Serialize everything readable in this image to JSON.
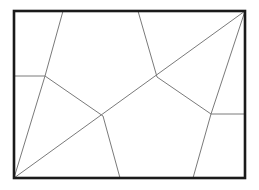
{
  "diagram": {
    "type": "line-diagram",
    "canvas": {
      "width": 259,
      "height": 190,
      "background": "#ffffff"
    },
    "style": {
      "frame_color": "#1a1a1a",
      "frame_width": 2.6,
      "line_color": "#7a7a7a",
      "line_width": 1,
      "fill_color": "#ffffff"
    },
    "frame": {
      "name": "bounding-rectangle",
      "x": 14,
      "y": 11,
      "width": 231,
      "height": 167,
      "corners": {
        "top_left": [
          14,
          11
        ],
        "top_right": [
          245,
          11
        ],
        "bottom_right": [
          245,
          178
        ],
        "bottom_left": [
          14,
          178
        ]
      }
    },
    "vertices": [
      {
        "id": "A",
        "label": "junction-upper-left",
        "x": 45,
        "y": 76,
        "degree": 3
      },
      {
        "id": "B",
        "label": "junction-center-left",
        "x": 103,
        "y": 116,
        "degree": 4
      },
      {
        "id": "C",
        "label": "junction-center-right",
        "x": 157,
        "y": 77,
        "degree": 4
      },
      {
        "id": "D",
        "label": "junction-right",
        "x": 211,
        "y": 114,
        "degree": 3
      },
      {
        "id": "T1",
        "label": "top-edge-point-1",
        "x": 63,
        "y": 11,
        "degree": 1
      },
      {
        "id": "T2",
        "label": "top-edge-point-2",
        "x": 138,
        "y": 11,
        "degree": 1
      },
      {
        "id": "L1",
        "label": "left-edge-point",
        "x": 14,
        "y": 76,
        "degree": 1
      },
      {
        "id": "R1",
        "label": "right-edge-point",
        "x": 245,
        "y": 114,
        "degree": 1
      },
      {
        "id": "B1",
        "label": "bottom-edge-point-1",
        "x": 120,
        "y": 178,
        "degree": 1
      },
      {
        "id": "B2",
        "label": "bottom-edge-point-2",
        "x": 193,
        "y": 178,
        "degree": 1
      },
      {
        "id": "TR",
        "label": "corner-top-right",
        "x": 245,
        "y": 11,
        "degree": 2
      },
      {
        "id": "BL",
        "label": "corner-bottom-left",
        "x": 14,
        "y": 178,
        "degree": 2
      }
    ],
    "segments": [
      {
        "name": "segment-left-horizontal",
        "from": "L1",
        "to": "A",
        "x1": 14,
        "y1": 76,
        "x2": 45,
        "y2": 76
      },
      {
        "name": "segment-a-to-top-edge",
        "from": "A",
        "to": "T1",
        "x1": 45,
        "y1": 76,
        "x2": 63,
        "y2": 11
      },
      {
        "name": "segment-a-to-b",
        "from": "A",
        "to": "B",
        "x1": 45,
        "y1": 76,
        "x2": 103,
        "y2": 116
      },
      {
        "name": "segment-a-to-bottom-left-corner",
        "from": "A",
        "to": "BL",
        "x1": 45,
        "y1": 76,
        "x2": 14,
        "y2": 178
      },
      {
        "name": "segment-b-to-bottom-edge",
        "from": "B",
        "to": "B1",
        "x1": 103,
        "y1": 116,
        "x2": 120,
        "y2": 178
      },
      {
        "name": "segment-c-to-top-edge",
        "from": "C",
        "to": "T2",
        "x1": 157,
        "y1": 77,
        "x2": 138,
        "y2": 11
      },
      {
        "name": "segment-c-to-d",
        "from": "C",
        "to": "D",
        "x1": 157,
        "y1": 77,
        "x2": 211,
        "y2": 114
      },
      {
        "name": "segment-main-diagonal",
        "from": "BL",
        "to": "TR",
        "x1": 14,
        "y1": 178,
        "x2": 245,
        "y2": 11
      },
      {
        "name": "segment-d-to-right-edge",
        "from": "D",
        "to": "R1",
        "x1": 211,
        "y1": 114,
        "x2": 245,
        "y2": 114
      },
      {
        "name": "segment-d-to-bottom-edge",
        "from": "D",
        "to": "B2",
        "x1": 211,
        "y1": 114,
        "x2": 193,
        "y2": 178
      },
      {
        "name": "segment-d-to-top-right-corner",
        "from": "D",
        "to": "TR",
        "x1": 211,
        "y1": 114,
        "x2": 245,
        "y2": 11
      }
    ],
    "regions": [
      {
        "name": "region-upper-left",
        "cells": 1
      },
      {
        "name": "region-upper-middle",
        "cells": 1
      },
      {
        "name": "region-left-lower",
        "cells": 1
      },
      {
        "name": "region-center",
        "cells": 1
      },
      {
        "name": "region-lower-middle",
        "cells": 1
      },
      {
        "name": "region-right-upper",
        "cells": 1
      },
      {
        "name": "region-right-lower",
        "cells": 1
      },
      {
        "name": "region-far-right",
        "cells": 1
      }
    ]
  }
}
